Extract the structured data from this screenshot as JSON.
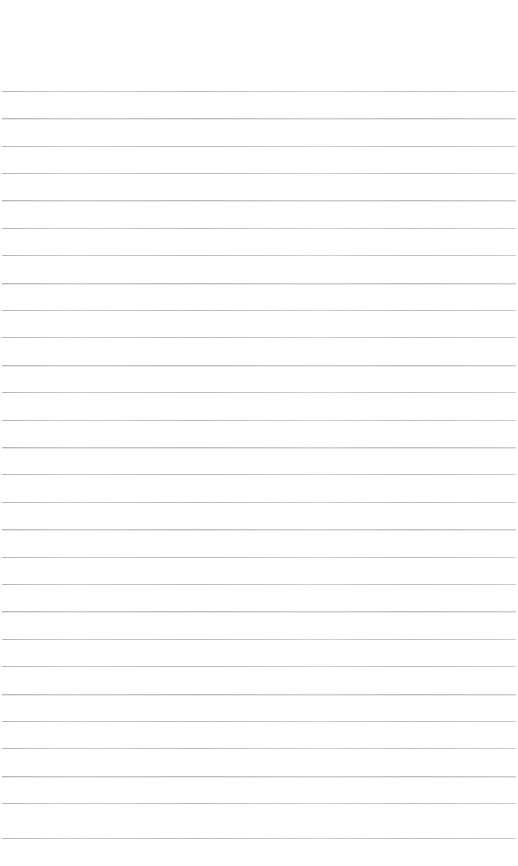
{
  "page": {
    "kind": "lined-notebook-page",
    "width_px": 518,
    "height_px": 866,
    "background_color": "#ffffff",
    "content_text": "",
    "is_blank": "true"
  },
  "ruling": {
    "line_color": "#b4b8bd",
    "line_thickness_px": 1,
    "line_spacing_px": 27.3,
    "first_line_y_px": 91,
    "last_line_y_px": 838,
    "line_count": 28,
    "left_inset_px": 2,
    "right_inset_px": 2,
    "header_margin_height_px": 91,
    "style": "wide-ruled-horizontal",
    "has_vertical_margin_rule": "false"
  },
  "lines": [
    {
      "index": 1,
      "y": 91,
      "text": ""
    },
    {
      "index": 2,
      "y": 118,
      "text": ""
    },
    {
      "index": 3,
      "y": 146,
      "text": ""
    },
    {
      "index": 4,
      "y": 173,
      "text": ""
    },
    {
      "index": 5,
      "y": 200,
      "text": ""
    },
    {
      "index": 6,
      "y": 228,
      "text": ""
    },
    {
      "index": 7,
      "y": 255,
      "text": ""
    },
    {
      "index": 8,
      "y": 283,
      "text": ""
    },
    {
      "index": 9,
      "y": 310,
      "text": ""
    },
    {
      "index": 10,
      "y": 337,
      "text": ""
    },
    {
      "index": 11,
      "y": 365,
      "text": ""
    },
    {
      "index": 12,
      "y": 392,
      "text": ""
    },
    {
      "index": 13,
      "y": 420,
      "text": ""
    },
    {
      "index": 14,
      "y": 447,
      "text": ""
    },
    {
      "index": 15,
      "y": 474,
      "text": ""
    },
    {
      "index": 16,
      "y": 502,
      "text": ""
    },
    {
      "index": 17,
      "y": 529,
      "text": ""
    },
    {
      "index": 18,
      "y": 557,
      "text": ""
    },
    {
      "index": 19,
      "y": 584,
      "text": ""
    },
    {
      "index": 20,
      "y": 611,
      "text": ""
    },
    {
      "index": 21,
      "y": 639,
      "text": ""
    },
    {
      "index": 22,
      "y": 666,
      "text": ""
    },
    {
      "index": 23,
      "y": 694,
      "text": ""
    },
    {
      "index": 24,
      "y": 721,
      "text": ""
    },
    {
      "index": 25,
      "y": 748,
      "text": ""
    },
    {
      "index": 26,
      "y": 776,
      "text": ""
    },
    {
      "index": 27,
      "y": 803,
      "text": ""
    },
    {
      "index": 28,
      "y": 838,
      "text": ""
    }
  ]
}
